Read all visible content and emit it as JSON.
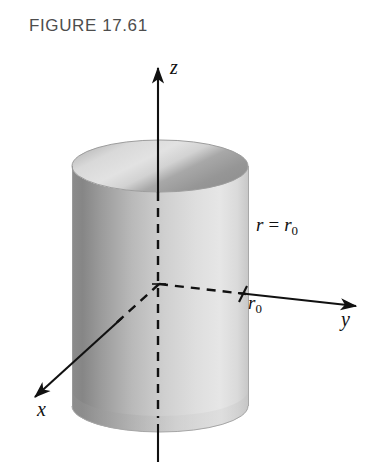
{
  "figure": {
    "title": "FIGURE 17.61",
    "caption_color": "#4d4d4d",
    "background_color": "#ffffff",
    "width": 392,
    "height": 475
  },
  "labels": {
    "z_axis": "z",
    "y_axis": "y",
    "x_axis": "x",
    "radius_tick": "r",
    "radius_tick_sub": "0",
    "surface_equation_lhs": "r",
    "surface_equation_op": "=",
    "surface_equation_rhs": "r",
    "surface_equation_rhs_sub": "0"
  },
  "diagram": {
    "type": "3d-cylinder-coordinate-axes",
    "shape": "cylinder",
    "origin": {
      "x": 159,
      "y": 284
    },
    "cylinder": {
      "center_x": 160,
      "left_x": 72,
      "right_x": 249,
      "top_ellipse_center_y": 166,
      "bottom_ellipse_center_y": 406,
      "ellipse_rx": 88,
      "ellipse_ry": 26,
      "surface_light": "#e4e4e4",
      "surface_mid": "#b4b4b4",
      "surface_dark": "#7e7e7e",
      "top_face_light": "#dcdcdc",
      "top_face_dark": "#979797",
      "outline_color": "#9a9a9a"
    },
    "axes": [
      {
        "name": "z",
        "tip": {
          "x": 158,
          "y": 62
        },
        "tail": {
          "x": 158,
          "y": 462
        },
        "solid_above_cylinder": true,
        "dashed_inside_cylinder": true
      },
      {
        "name": "y",
        "tip": {
          "x": 356,
          "y": 305
        },
        "tail": {
          "x": 159,
          "y": 284
        },
        "dashed_inside_cylinder": true
      },
      {
        "name": "x",
        "tip": {
          "x": 32,
          "y": 400
        },
        "tail": {
          "x": 159,
          "y": 284
        },
        "dashed_inside_cylinder": true
      }
    ],
    "tick_marks": [
      {
        "label": "r_0",
        "axis": "y",
        "x": 243,
        "y": 294
      }
    ],
    "stroke_color": "#111111"
  }
}
